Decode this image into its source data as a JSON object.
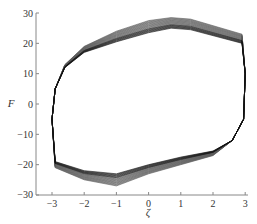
{
  "chart_data": {
    "type": "line",
    "title": "",
    "xlabel": "ζ",
    "ylabel": "F",
    "xlim": [
      -3.5,
      3
    ],
    "ylim": [
      -30,
      30
    ],
    "xticks": [
      -3,
      -2,
      -1,
      0,
      1,
      2,
      3
    ],
    "yticks": [
      30,
      20,
      10,
      0,
      -10,
      -20,
      -30
    ],
    "grid": false,
    "legend": null,
    "loop_outer": {
      "x": [
        -3.0,
        -2.9,
        -2.6,
        -2.0,
        -1.0,
        0.0,
        0.7,
        1.3,
        2.9,
        3.0,
        2.95,
        2.6,
        2.0,
        1.0,
        0.0,
        -1.0,
        -2.0,
        -2.9,
        -3.0
      ],
      "y": [
        -5,
        5,
        13,
        19,
        24,
        27.5,
        28.5,
        28,
        23,
        10,
        -5,
        -12,
        -17,
        -20,
        -23,
        -27,
        -25,
        -21,
        -5
      ]
    },
    "loop_inner": {
      "x": [
        -3.0,
        -2.9,
        -2.6,
        -2.0,
        -1.0,
        0.0,
        0.7,
        1.3,
        2.9,
        3.0,
        2.95,
        2.6,
        2.0,
        1.0,
        0.0,
        -1.0,
        -2.0,
        -2.9,
        -3.0
      ],
      "y": [
        -5,
        5,
        12,
        17,
        20.5,
        23.5,
        25,
        24.5,
        20,
        10,
        -5,
        -12,
        -15.5,
        -17.5,
        -20,
        -23,
        -22,
        -19,
        -5
      ]
    },
    "cycles": 20
  }
}
